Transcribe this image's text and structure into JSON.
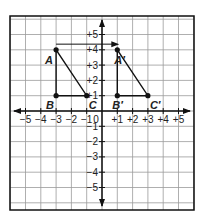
{
  "diagram": {
    "type": "coordinate-plane-translation",
    "grid": {
      "x_range": [
        -6,
        6
      ],
      "y_range": [
        -6,
        6
      ],
      "step": 1
    },
    "x_tick_labels": [
      "−5",
      "−4",
      "−3",
      "−2",
      "−1",
      "0",
      "+1",
      "+2",
      "+3",
      "+4",
      "+5"
    ],
    "y_tick_labels_pos": [
      "+5",
      "+4",
      "+3",
      "+2",
      "+1"
    ],
    "y_tick_labels_neg": [
      "−1",
      "−2",
      "−3",
      "−4",
      "−5"
    ],
    "origin_label": "0",
    "triangle_original": {
      "vertices": [
        {
          "label": "A",
          "x": -3,
          "y": 4
        },
        {
          "label": "B",
          "x": -3,
          "y": 1
        },
        {
          "label": "C",
          "x": -1,
          "y": 1
        }
      ]
    },
    "triangle_image": {
      "vertices": [
        {
          "label": "A′",
          "x": 1,
          "y": 4
        },
        {
          "label": "B′",
          "x": 1,
          "y": 1
        },
        {
          "label": "C′",
          "x": 3,
          "y": 1
        }
      ]
    },
    "translation_arrow": {
      "from_x": -3,
      "to_x": 1,
      "y": 4.5,
      "description": "4 units right"
    },
    "colors": {
      "line": "#111111",
      "grid": "#9a9a9a",
      "background": "#ffffff"
    }
  }
}
